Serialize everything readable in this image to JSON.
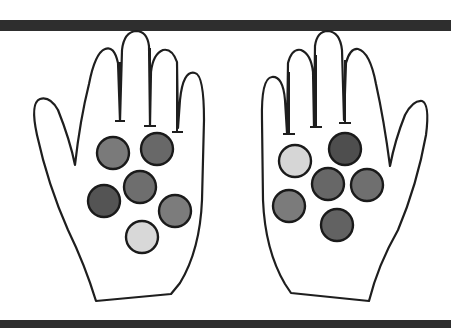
{
  "figure": {
    "bar_color": "#2e2e2e",
    "outline_color": "#1e1e1e"
  },
  "hands": [
    {
      "side": "left",
      "thumb": "left",
      "coins": [
        {
          "cx": 113,
          "cy": 153,
          "r": 16,
          "fill": "#7a7a7a"
        },
        {
          "cx": 157,
          "cy": 149,
          "r": 16,
          "fill": "#686868"
        },
        {
          "cx": 140,
          "cy": 187,
          "r": 16,
          "fill": "#6e6e6e"
        },
        {
          "cx": 104,
          "cy": 201,
          "r": 16,
          "fill": "#545454"
        },
        {
          "cx": 175,
          "cy": 211,
          "r": 16,
          "fill": "#7c7c7c"
        },
        {
          "cx": 142,
          "cy": 237,
          "r": 16,
          "fill": "#d8d8d8"
        }
      ]
    },
    {
      "side": "right",
      "thumb": "right",
      "coins": [
        {
          "cx": 295,
          "cy": 161,
          "r": 16,
          "fill": "#d6d6d6"
        },
        {
          "cx": 345,
          "cy": 149,
          "r": 16,
          "fill": "#4e4e4e"
        },
        {
          "cx": 328,
          "cy": 184,
          "r": 16,
          "fill": "#676767"
        },
        {
          "cx": 367,
          "cy": 185,
          "r": 16,
          "fill": "#6f6f6f"
        },
        {
          "cx": 289,
          "cy": 206,
          "r": 16,
          "fill": "#7b7b7b"
        },
        {
          "cx": 337,
          "cy": 225,
          "r": 16,
          "fill": "#626262"
        }
      ]
    }
  ]
}
